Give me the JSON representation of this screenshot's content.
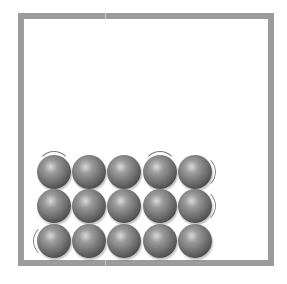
{
  "diagram": {
    "title": "",
    "container": {
      "border_color": "#9b9b9b",
      "fill": "#ffffff"
    },
    "particles": {
      "rows": 3,
      "columns": 5,
      "count": 15,
      "color": "#6c6c6c",
      "vibration_marks": [
        {
          "row": 0,
          "col": 0,
          "side": "top"
        },
        {
          "row": 0,
          "col": 3,
          "side": "top"
        },
        {
          "row": 0,
          "col": 4,
          "side": "right"
        },
        {
          "row": 1,
          "col": 4,
          "side": "right"
        },
        {
          "row": 2,
          "col": 0,
          "side": "left"
        }
      ]
    }
  }
}
